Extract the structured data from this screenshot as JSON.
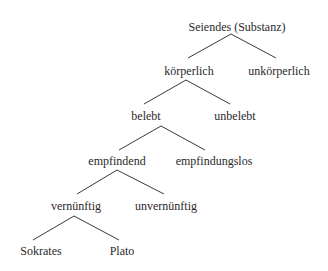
{
  "diagram": {
    "type": "tree",
    "title": "Seiendes (Substanz)",
    "nodes": [
      {
        "id": "seiendes",
        "label": "Seiendes (Substanz)",
        "x": 237,
        "y": 20
      },
      {
        "id": "koerperlich",
        "label": "körperlich",
        "x": 189,
        "y": 64
      },
      {
        "id": "unkoerperlich",
        "label": "unkörperlich",
        "x": 279,
        "y": 64
      },
      {
        "id": "belebt",
        "label": "belebt",
        "x": 146,
        "y": 109
      },
      {
        "id": "unbelebt",
        "label": "unbelebt",
        "x": 235,
        "y": 109
      },
      {
        "id": "empfindend",
        "label": "empfindend",
        "x": 117,
        "y": 154
      },
      {
        "id": "empfindungslos",
        "label": "empfindungslos",
        "x": 214,
        "y": 154
      },
      {
        "id": "vernuenftig",
        "label": "vernünftig",
        "x": 76,
        "y": 199
      },
      {
        "id": "unvernuenftig",
        "label": "unvernünftig",
        "x": 166,
        "y": 199
      },
      {
        "id": "sokrates",
        "label": "Sokrates",
        "x": 41,
        "y": 244
      },
      {
        "id": "plato",
        "label": "Plato",
        "x": 122,
        "y": 244
      }
    ],
    "edges": [
      {
        "from": "seiendes",
        "to": "koerperlich",
        "x1": 231,
        "y1": 34,
        "x2": 188,
        "y2": 58
      },
      {
        "from": "seiendes",
        "to": "unkoerperlich",
        "x1": 231,
        "y1": 34,
        "x2": 276,
        "y2": 58
      },
      {
        "from": "koerperlich",
        "to": "belebt",
        "x1": 186,
        "y1": 80,
        "x2": 144,
        "y2": 104
      },
      {
        "from": "koerperlich",
        "to": "unbelebt",
        "x1": 186,
        "y1": 80,
        "x2": 230,
        "y2": 104
      },
      {
        "from": "belebt",
        "to": "empfindend",
        "x1": 161,
        "y1": 126,
        "x2": 119,
        "y2": 150
      },
      {
        "from": "belebt",
        "to": "empfindungslos",
        "x1": 161,
        "y1": 126,
        "x2": 205,
        "y2": 150
      },
      {
        "from": "empfindend",
        "to": "vernuenftig",
        "x1": 117,
        "y1": 170,
        "x2": 77,
        "y2": 194
      },
      {
        "from": "empfindend",
        "to": "unvernuenftig",
        "x1": 117,
        "y1": 170,
        "x2": 164,
        "y2": 194
      },
      {
        "from": "vernuenftig",
        "to": "sokrates",
        "x1": 74,
        "y1": 216,
        "x2": 33,
        "y2": 240
      },
      {
        "from": "vernuenftig",
        "to": "plato",
        "x1": 74,
        "y1": 216,
        "x2": 119,
        "y2": 240
      }
    ]
  }
}
